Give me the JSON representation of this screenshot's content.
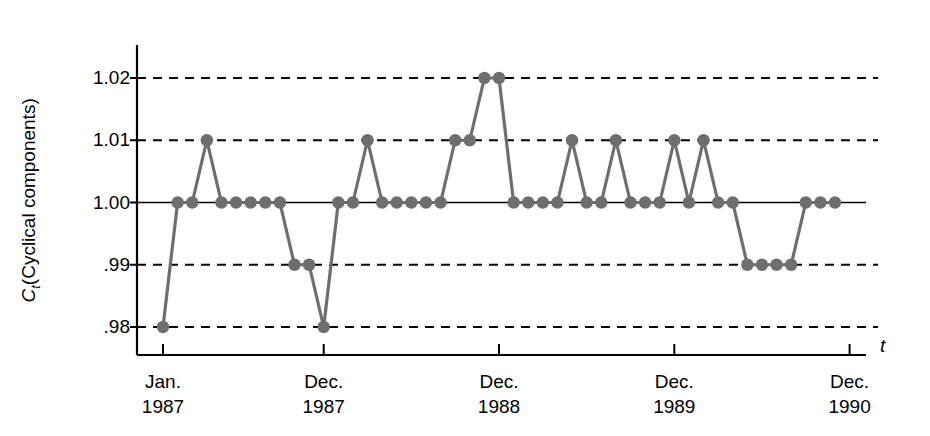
{
  "chart_data": {
    "type": "line",
    "title": "",
    "subtitle": "",
    "xlabel": "t",
    "ylabel": "C_t (Cyclical components)",
    "ylabel_symbol": "C",
    "ylabel_subscript": "t",
    "ylabel_paren": "(Cyclical components)",
    "ylim": [
      0.975,
      1.025
    ],
    "yticks": [
      0.98,
      0.99,
      1.0,
      1.01,
      1.02
    ],
    "ytick_labels": [
      ".98",
      ".99",
      "1.00",
      "1.01",
      "1.02"
    ],
    "grid": "horizontal-dashed",
    "legend": "none",
    "marker": "filled-circle",
    "series_color": "#6e6e6e",
    "axis_color": "#000000",
    "grid_color": "#000000",
    "xtick_labels": [
      {
        "line1": "Jan.",
        "line2": "1987",
        "index": 0
      },
      {
        "line1": "Dec.",
        "line2": "1987",
        "index": 11
      },
      {
        "line1": "Dec.",
        "line2": "1988",
        "index": 23
      },
      {
        "line1": "Dec.",
        "line2": "1989",
        "index": 35
      },
      {
        "line1": "Dec.",
        "line2": "1990",
        "index": 47
      }
    ],
    "x": [
      0,
      1,
      2,
      3,
      4,
      5,
      6,
      7,
      8,
      9,
      10,
      11,
      12,
      13,
      14,
      15,
      16,
      17,
      18,
      19,
      20,
      21,
      22,
      23,
      24,
      25,
      26,
      27,
      28,
      29,
      30,
      31,
      32,
      33,
      34,
      35,
      36,
      37,
      38,
      39,
      40,
      41,
      42,
      43,
      44,
      45,
      46
    ],
    "values": [
      0.98,
      1.0,
      1.0,
      1.01,
      1.0,
      1.0,
      1.0,
      1.0,
      1.0,
      0.99,
      0.99,
      0.98,
      1.0,
      1.0,
      1.01,
      1.0,
      1.0,
      1.0,
      1.0,
      1.0,
      1.01,
      1.01,
      1.02,
      1.02,
      1.0,
      1.0,
      1.0,
      1.0,
      1.01,
      1.0,
      1.0,
      1.01,
      1.0,
      1.0,
      1.0,
      1.01,
      1.0,
      1.01,
      1.0,
      1.0,
      0.99,
      0.99,
      0.99,
      0.99,
      1.0,
      1.0,
      1.0
    ]
  }
}
